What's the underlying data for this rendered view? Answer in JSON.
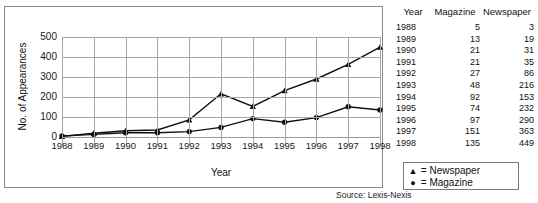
{
  "chart_data": {
    "type": "line",
    "title": "",
    "xlabel": "Year",
    "ylabel": "No. of Appearances",
    "categories": [
      "1988",
      "1989",
      "1990",
      "1991",
      "1992",
      "1993",
      "1994",
      "1995",
      "1996",
      "1997",
      "1998"
    ],
    "series": [
      {
        "name": "Newspaper",
        "marker": "triangle",
        "values": [
          3,
          19,
          31,
          35,
          86,
          216,
          153,
          232,
          290,
          363,
          449
        ]
      },
      {
        "name": "Magazine",
        "marker": "circle",
        "values": [
          5,
          13,
          21,
          21,
          27,
          48,
          92,
          74,
          97,
          151,
          135
        ]
      }
    ],
    "ylim": [
      0,
      500
    ],
    "yticks": [
      0,
      100,
      200,
      300,
      400,
      500
    ],
    "grid": true,
    "legend_position": "outside-bottom-right"
  },
  "axes": {
    "y_title": "No. of Appearances",
    "x_title": "Year",
    "y_tick_labels": [
      "500",
      "400",
      "300",
      "200",
      "100",
      "0"
    ],
    "x_tick_labels": [
      "1988",
      "1989",
      "1990",
      "1991",
      "1992",
      "1993",
      "1994",
      "1995",
      "1996",
      "1997",
      "1998"
    ]
  },
  "legend": {
    "items": [
      {
        "marker_glyph": "▲",
        "equals": "=",
        "label": "Newspaper"
      },
      {
        "marker_glyph": "●",
        "equals": "=",
        "label": "Magazine"
      }
    ],
    "rows": [
      "▲  =  Newspaper",
      "●  =  Magazine"
    ]
  },
  "table": {
    "headers": [
      "Year",
      "Magazine",
      "Newspaper"
    ],
    "rows": [
      [
        "1988",
        "5",
        "3"
      ],
      [
        "1989",
        "13",
        "19"
      ],
      [
        "1990",
        "21",
        "31"
      ],
      [
        "1991",
        "21",
        "35"
      ],
      [
        "1992",
        "27",
        "86"
      ],
      [
        "1993",
        "48",
        "216"
      ],
      [
        "1994",
        "92",
        "153"
      ],
      [
        "1995",
        "74",
        "232"
      ],
      [
        "1996",
        "97",
        "290"
      ],
      [
        "1997",
        "151",
        "363"
      ],
      [
        "1998",
        "135",
        "449"
      ]
    ]
  },
  "source": "Source: Lexis-Nexis",
  "colors": {
    "line": "#111111",
    "grid": "#a8a8a8",
    "frame": "#8a8a8a",
    "text": "#111111",
    "background": "#ffffff"
  }
}
